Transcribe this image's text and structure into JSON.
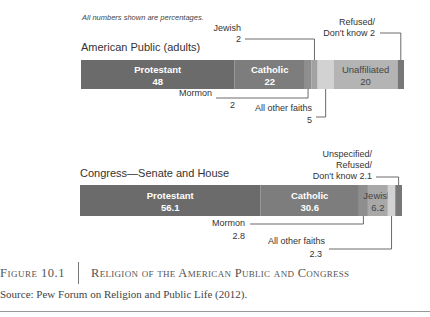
{
  "chart_data": [
    {
      "type": "bar",
      "orientation": "horizontal-stacked",
      "title": "American Public (adults)",
      "note": "All numbers shown are percentages.",
      "xlim": [
        0,
        100
      ],
      "segments": [
        {
          "name": "Protestant",
          "value": 48,
          "color": "#6b6b6b",
          "label_inside": true,
          "label_style": "light"
        },
        {
          "name": "Catholic",
          "value": 22,
          "color": "#7d7d7d",
          "label_inside": true,
          "label_style": "light"
        },
        {
          "name": "Mormon",
          "value": 2,
          "color": "#8e8e8e",
          "label_inside": false
        },
        {
          "name": "Jewish",
          "value": 2,
          "color": "#a2a2a2",
          "label_inside": false
        },
        {
          "name": "All other faiths",
          "value": 5,
          "color": "#d2d2d2",
          "label_inside": false
        },
        {
          "name": "Unaffiliated",
          "value": 20,
          "color": "#b4b4b4",
          "label_inside": true,
          "label_style": "dark"
        },
        {
          "name": "Refused/ Don't know",
          "value": 2,
          "color": "#777777",
          "label_inside": false
        }
      ],
      "annotations": [
        {
          "segment": "Jewish",
          "lines": [
            "Jewish",
            "2"
          ],
          "position": "above"
        },
        {
          "segment": "Refused/ Don't know",
          "lines": [
            "Refused/",
            "Don't know 2"
          ],
          "position": "above"
        },
        {
          "segment": "Mormon",
          "lines": [
            "Mormon",
            "2"
          ],
          "position": "below"
        },
        {
          "segment": "All other faiths",
          "lines": [
            "All other faiths",
            "5"
          ],
          "position": "below"
        }
      ]
    },
    {
      "type": "bar",
      "orientation": "horizontal-stacked",
      "title": "Congress—Senate and House",
      "xlim": [
        0,
        100
      ],
      "segments": [
        {
          "name": "Protestant",
          "value": 56.1,
          "color": "#6b6b6b",
          "label_inside": true,
          "label_style": "light"
        },
        {
          "name": "Catholic",
          "value": 30.6,
          "color": "#7d7d7d",
          "label_inside": true,
          "label_style": "light"
        },
        {
          "name": "Mormon",
          "value": 2.8,
          "color": "#8e8e8e",
          "label_inside": false
        },
        {
          "name": "Jewish",
          "value": 6.2,
          "color": "#a8a8a8",
          "label_inside": true,
          "label_style": "dark"
        },
        {
          "name": "All other faiths",
          "value": 2.3,
          "color": "#d2d2d2",
          "label_inside": false
        },
        {
          "name": "Unspecified/ Refused/ Don't know",
          "value": 2.1,
          "color": "#777777",
          "label_inside": false
        }
      ],
      "annotations": [
        {
          "segment": "Unspecified/ Refused/ Don't know",
          "lines": [
            "Unspecified/",
            "Refused/",
            "Don't know 2.1"
          ],
          "position": "above"
        },
        {
          "segment": "Mormon",
          "lines": [
            "Mormon",
            "2.8"
          ],
          "position": "below"
        },
        {
          "segment": "All other faiths",
          "lines": [
            "All other faiths",
            "2.3"
          ],
          "position": "below"
        }
      ]
    }
  ],
  "caption": {
    "figure_number": "Figure 10.1",
    "figure_title": "Religion of the American Public and Congress",
    "source": "Source: Pew Forum on Religion and Public Life (2012)."
  }
}
